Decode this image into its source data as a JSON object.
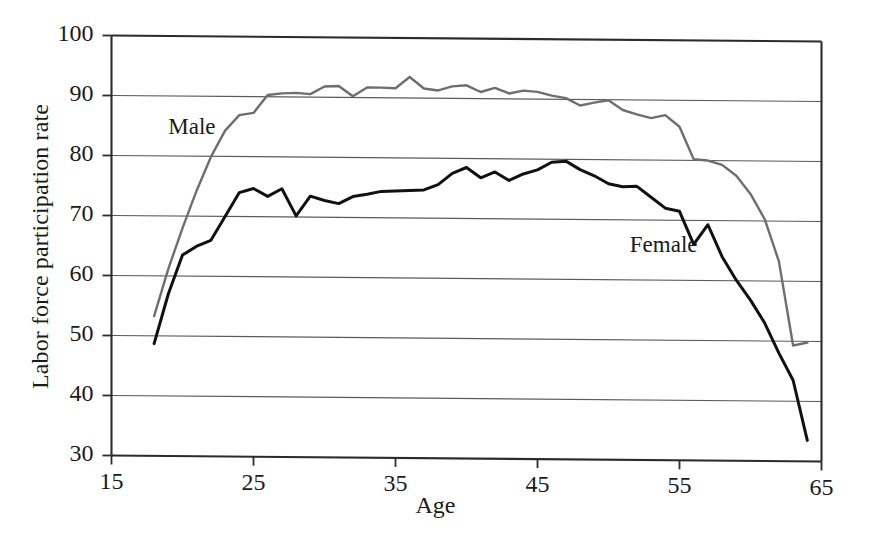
{
  "chart_data": {
    "type": "line",
    "title": "",
    "xlabel": "Age",
    "ylabel": "Labor force participation rate",
    "xlim": [
      15,
      65
    ],
    "ylim": [
      30,
      100
    ],
    "xticks": [
      "15",
      "25",
      "35",
      "45",
      "55",
      "65"
    ],
    "xtick_values": [
      15,
      25,
      35,
      45,
      55,
      65
    ],
    "yticks": [
      "30",
      "40",
      "50",
      "60",
      "70",
      "80",
      "90",
      "100"
    ],
    "ytick_values": [
      30,
      40,
      50,
      60,
      70,
      80,
      90,
      100
    ],
    "grid": "horizontal",
    "legend_position": "inline-annotations",
    "x": [
      18,
      19,
      20,
      21,
      22,
      23,
      24,
      25,
      26,
      27,
      28,
      29,
      30,
      31,
      32,
      33,
      34,
      35,
      36,
      37,
      38,
      39,
      40,
      41,
      42,
      43,
      44,
      45,
      46,
      47,
      48,
      49,
      50,
      51,
      52,
      53,
      54,
      55,
      56,
      57,
      58,
      59,
      60,
      61,
      62,
      63,
      64
    ],
    "series": [
      {
        "name": "Male",
        "color": "#6e6e6e",
        "values": [
          53.3,
          61.2,
          68.0,
          74.3,
          79.9,
          84.3,
          86.9,
          87.3,
          90.3,
          90.6,
          90.7,
          90.5,
          91.8,
          91.9,
          90.2,
          91.7,
          91.7,
          91.6,
          93.5,
          91.6,
          91.3,
          92.0,
          92.2,
          91.1,
          91.8,
          90.9,
          91.4,
          91.2,
          90.6,
          90.2,
          89.0,
          89.5,
          89.9,
          88.3,
          87.6,
          87.0,
          87.5,
          85.6,
          80.2,
          80.0,
          79.3,
          77.5,
          74.5,
          70.3,
          63.3,
          49.3,
          49.8
        ]
      },
      {
        "name": "Female",
        "color": "#111111",
        "values": [
          48.7,
          57.0,
          63.5,
          65.0,
          66.0,
          70.0,
          74.0,
          74.7,
          73.4,
          74.7,
          70.2,
          73.5,
          72.8,
          72.3,
          73.5,
          73.9,
          74.4,
          74.5,
          74.6,
          74.7,
          75.6,
          77.5,
          78.5,
          76.8,
          77.8,
          76.4,
          77.5,
          78.2,
          79.5,
          79.7,
          78.3,
          77.3,
          76.0,
          75.5,
          75.6,
          73.8,
          72.0,
          71.5,
          66.0,
          69.3,
          64.0,
          60.1,
          56.8,
          53.0,
          48.0,
          43.5,
          33.5
        ]
      }
    ],
    "annotations": [
      {
        "label": "Male",
        "x": 19.0,
        "y": 84.5
      },
      {
        "label": "Female",
        "x": 51.5,
        "y": 65.5
      }
    ]
  },
  "axis": {
    "y_title": "Labor force participation rate",
    "x_title": "Age"
  }
}
